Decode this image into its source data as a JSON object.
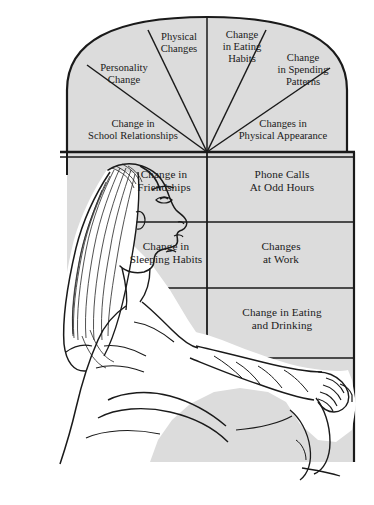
{
  "illustration": {
    "title": "Seated woman in profile leaning against a paneled wall",
    "subject": "woman-seated-profile",
    "style": "black-and-white line drawing"
  },
  "colors": {
    "panel_fill": "#dcdcdc",
    "line": "#1a1a1a",
    "background": "#ffffff",
    "figure_fill": "#ffffff",
    "text": "#1a1a1a"
  },
  "diagram": {
    "type": "warning-signs-panel-chart",
    "fan": {
      "vertex": {
        "x": 207,
        "y": 152
      },
      "segments": [
        {
          "id": "personality-change",
          "label_line1": "Personality",
          "label_line2": "Change"
        },
        {
          "id": "physical-changes",
          "label_line1": "Physical",
          "label_line2": "Changes"
        },
        {
          "id": "change-in-eating-habits",
          "label_line1": "Change",
          "label_line2": "in Eating",
          "label_line3": "Habits"
        },
        {
          "id": "change-in-spending-patterns",
          "label_line1": "Change",
          "label_line2": "in Spending",
          "label_line3": "Patterns"
        },
        {
          "id": "change-in-school-relationships",
          "label_line1": "Change in",
          "label_line2": "School Relationships"
        },
        {
          "id": "changes-in-physical-appearance",
          "label_line1": "Changes in",
          "label_line2": "Physical Appearance"
        }
      ]
    },
    "grid": {
      "cells": [
        {
          "id": "change-in-friendships",
          "label_line1": "Change in",
          "label_line2": "Friendships"
        },
        {
          "id": "phone-calls-at-odd-hours",
          "label_line1": "Phone Calls",
          "label_line2": "At Odd Hours"
        },
        {
          "id": "change-in-sleeping-habits",
          "label_line1": "Change in",
          "label_line2": "Sleeping Habits"
        },
        {
          "id": "changes-at-work",
          "label_line1": "Changes",
          "label_line2": "at Work"
        },
        {
          "id": "change-in-eating-and-drinking",
          "label_line1": "Change in Eating",
          "label_line2": "and Drinking"
        }
      ]
    }
  }
}
